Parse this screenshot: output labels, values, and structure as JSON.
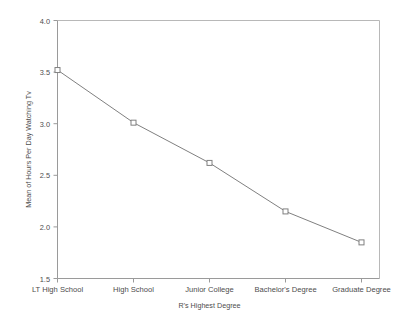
{
  "chart_data": {
    "type": "line",
    "title": "",
    "subtitle": "",
    "xlabel": "R's Highest Degree",
    "ylabel": "Mean of Hours Per Day Watching Tv",
    "categories": [
      "LT High School",
      "High School",
      "Junior College",
      "Bachelor's Degree",
      "Graduate Degree"
    ],
    "values": [
      3.52,
      3.01,
      2.62,
      2.15,
      1.85
    ],
    "series": [
      {
        "name": "Mean of Hours Per Day Watching Tv",
        "values": [
          3.52,
          3.01,
          2.62,
          2.15,
          1.85
        ]
      }
    ],
    "ylim": [
      1.5,
      4.0
    ],
    "ytick_labels": [
      "1.5",
      "2.0",
      "2.5",
      "3.0",
      "3.5",
      "4.0"
    ],
    "ytick_values": [
      1.5,
      2.0,
      2.5,
      3.0,
      3.5,
      4.0
    ],
    "grid": false,
    "legend": "none",
    "marker": "open-square",
    "line_color": "#808080",
    "marker_color": "#808080",
    "frame_color": "#b3b3b3",
    "background_color": "#ffffff",
    "text_color": "#4d4d4d"
  },
  "axes": {
    "y_title": "Mean of Hours Per Day Watching Tv",
    "x_title": "R's Highest Degree",
    "y_ticks": [
      {
        "label": "4.0",
        "value": 4.0
      },
      {
        "label": "3.5",
        "value": 3.5
      },
      {
        "label": "3.0",
        "value": 3.0
      },
      {
        "label": "2.5",
        "value": 2.5
      },
      {
        "label": "2.0",
        "value": 2.0
      },
      {
        "label": "1.5",
        "value": 1.5
      }
    ],
    "x_ticks": [
      {
        "label": "LT High School",
        "value": 3.52
      },
      {
        "label": "High School",
        "value": 3.01
      },
      {
        "label": "Junior College",
        "value": 2.62
      },
      {
        "label": "Bachelor's Degree",
        "value": 2.15
      },
      {
        "label": "Graduate Degree",
        "value": 1.85
      }
    ]
  }
}
